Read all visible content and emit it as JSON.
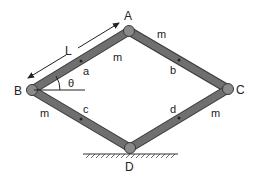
{
  "diagram": {
    "joints": [
      {
        "id": "A",
        "label": "A",
        "x": 129,
        "y": 31
      },
      {
        "id": "B",
        "label": "B",
        "x": 32,
        "y": 90
      },
      {
        "id": "C",
        "label": "C",
        "x": 228,
        "y": 89
      },
      {
        "id": "D",
        "label": "D",
        "x": 130,
        "y": 148
      }
    ],
    "bars": [
      {
        "from": "B",
        "to": "A",
        "mass_label": "m",
        "center_label": "a"
      },
      {
        "from": "A",
        "to": "C",
        "mass_label": "m",
        "center_label": "b"
      },
      {
        "from": "B",
        "to": "D",
        "mass_label": "m",
        "center_label": "c"
      },
      {
        "from": "D",
        "to": "C",
        "mass_label": "m",
        "center_label": "d"
      }
    ],
    "length_label": "L",
    "angle_label": "θ",
    "ground_support": "D",
    "colors": {
      "bar": "#6f6f6f",
      "bar_edge": "#3a3a3a",
      "joint": "#8a8a8a",
      "text": "#222222"
    }
  }
}
